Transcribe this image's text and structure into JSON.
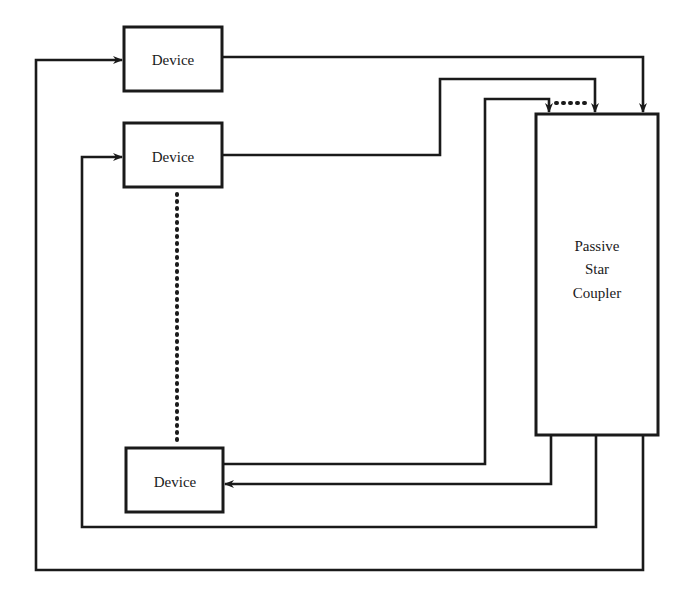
{
  "diagram": {
    "title": "",
    "devices": [
      {
        "id": "device-1",
        "label": "Device"
      },
      {
        "id": "device-2",
        "label": "Device"
      },
      {
        "id": "device-n",
        "label": "Device"
      }
    ],
    "coupler": {
      "label_lines": [
        "Passive",
        "Star",
        "Coupler"
      ]
    },
    "connections": [
      {
        "from": "device-1",
        "to": "coupler",
        "type": "transmit"
      },
      {
        "from": "device-2",
        "to": "coupler",
        "type": "transmit"
      },
      {
        "from": "device-n",
        "to": "coupler",
        "type": "transmit"
      },
      {
        "from": "coupler",
        "to": "device-n",
        "type": "receive"
      },
      {
        "from": "coupler",
        "to": "device-2",
        "type": "receive"
      },
      {
        "from": "coupler",
        "to": "device-1",
        "type": "receive"
      }
    ],
    "ellipsis": {
      "between": [
        "device-2",
        "device-n"
      ],
      "style": "dotted"
    }
  },
  "colors": {
    "line": "#1a1a1a",
    "background": "#ffffff"
  }
}
